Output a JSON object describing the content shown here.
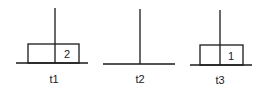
{
  "diagram": {
    "title": "",
    "towers": [
      {
        "label": "t1",
        "disks": [
          {
            "number": "2"
          }
        ]
      },
      {
        "label": "t2",
        "disks": []
      },
      {
        "label": "t3",
        "disks": [
          {
            "number": "1"
          }
        ]
      }
    ]
  },
  "colors": {
    "stroke": "#1a1a1a",
    "background": "#ffffff"
  }
}
